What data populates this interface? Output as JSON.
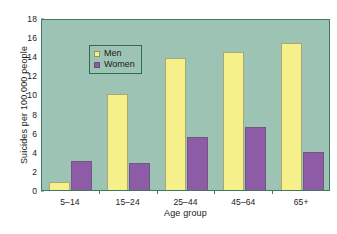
{
  "chart_data": {
    "type": "bar",
    "title": "",
    "xlabel": "Age group",
    "ylabel": "Suicides per 100,000 people",
    "categories": [
      "5–14",
      "15–24",
      "25–44",
      "45–64",
      "65+"
    ],
    "series": [
      {
        "name": "Men",
        "color": "#f5f08a",
        "values": [
          0.8,
          10.0,
          13.8,
          14.4,
          15.4
        ]
      },
      {
        "name": "Women",
        "color": "#8e5ba6",
        "values": [
          3.0,
          2.8,
          5.6,
          6.6,
          4.0
        ]
      }
    ],
    "ylim": [
      0,
      18
    ],
    "yticks": [
      0,
      2,
      4,
      6,
      8,
      10,
      12,
      14,
      16,
      18
    ],
    "grid": false,
    "legend_position": "top-left",
    "plot_background": "#9dc3b4",
    "axis_color": "#3f7a5e"
  }
}
